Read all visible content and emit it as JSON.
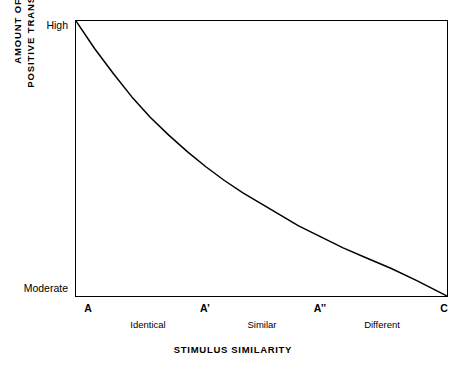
{
  "chart_data": {
    "type": "line",
    "title": "",
    "xlabel": "STIMULUS SIMILARITY",
    "ylabel": "AMOUNT OF POSITIVE TRANSFER",
    "ylabel_lines": [
      "AMOUNT OF",
      "POSITIVE TRANSFER"
    ],
    "grid": false,
    "legend": "none",
    "x_tick_labels": [
      "A",
      "A’",
      "A’’",
      "C"
    ],
    "x_tick_positions": [
      0,
      0.35,
      0.66,
      1.0
    ],
    "x_category_labels": [
      "Identical",
      "Similar",
      "Different"
    ],
    "x_category_positions": [
      0.175,
      0.505,
      0.83
    ],
    "y_tick_labels": [
      "High",
      "Moderate"
    ],
    "y_tick_positions": [
      1.0,
      0.0
    ],
    "ylim": [
      0,
      1
    ],
    "xlim": [
      0,
      1
    ],
    "series": [
      {
        "name": "positive transfer",
        "x": [
          0.0,
          0.05,
          0.1,
          0.15,
          0.2,
          0.25,
          0.3,
          0.35,
          0.4,
          0.45,
          0.5,
          0.55,
          0.6,
          0.66,
          0.72,
          0.78,
          0.85,
          0.92,
          1.0
        ],
        "values": [
          1.0,
          0.9,
          0.81,
          0.725,
          0.65,
          0.585,
          0.525,
          0.47,
          0.42,
          0.375,
          0.335,
          0.295,
          0.255,
          0.215,
          0.175,
          0.14,
          0.1,
          0.055,
          0.0
        ]
      }
    ],
    "annotations": []
  },
  "axes": {
    "y_high_label": "High",
    "y_moderate_label": "Moderate",
    "y_title_line1": "AMOUNT OF",
    "y_title_line2": "POSITIVE TRANSFER",
    "x_title": "STIMULUS SIMILARITY",
    "ticks": [
      {
        "label": "A",
        "left_px": 88
      },
      {
        "label": "A’",
        "left_px": 205
      },
      {
        "label": "A’’",
        "left_px": 320
      },
      {
        "label": "C",
        "left_px": 444
      }
    ],
    "categories": [
      {
        "label": "Identical",
        "left_px": 148
      },
      {
        "label": "Similar",
        "left_px": 262
      },
      {
        "label": "Different",
        "left_px": 382
      }
    ]
  },
  "style": {
    "line_color": "#000000",
    "frame_color": "#000000",
    "background": "#ffffff"
  }
}
